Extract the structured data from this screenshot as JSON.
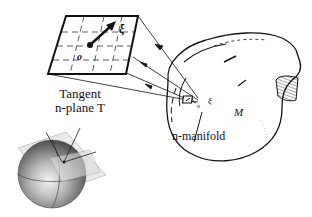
{
  "labels": {
    "tangent_plane": "Tangent n-plane T",
    "tangent_line1": "Tangent",
    "tangent_line2": "n-plane T",
    "manifold": "n-manifold",
    "manifold_symbol": "M",
    "vector_symbol": "ξ",
    "origin_symbol": "o",
    "small_vector_symbol": "ξ",
    "small_origin_symbol": "o"
  },
  "colors": {
    "ink": "#111111",
    "background": "#ffffff",
    "sphere_light": "#d8d8d8",
    "sphere_dark": "#3a3a3a",
    "plane_fill": "#e6e6e6"
  }
}
